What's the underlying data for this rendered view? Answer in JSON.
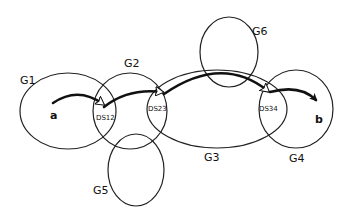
{
  "diagram": {
    "sets": [
      {
        "id": "G1",
        "label": "G1"
      },
      {
        "id": "G2",
        "label": "G2"
      },
      {
        "id": "G3",
        "label": "G3"
      },
      {
        "id": "G4",
        "label": "G4"
      },
      {
        "id": "G5",
        "label": "G5"
      },
      {
        "id": "G6",
        "label": "G6"
      }
    ],
    "nodes": {
      "start": "a",
      "end": "b"
    },
    "intersections": [
      {
        "label": "DS12",
        "between": [
          "G1",
          "G2"
        ]
      },
      {
        "label": "DS23",
        "between": [
          "G2",
          "G3"
        ]
      },
      {
        "label": "DS34",
        "between": [
          "G3",
          "G4"
        ]
      }
    ],
    "path": [
      "a",
      "DS12",
      "DS23",
      "DS34",
      "b"
    ]
  }
}
